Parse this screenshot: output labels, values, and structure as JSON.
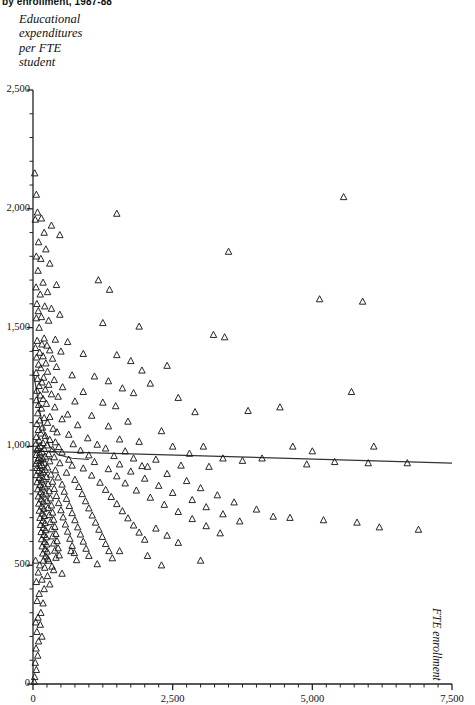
{
  "title": "by enrollment, 1987-88",
  "axis": {
    "y_label": "Educational\nexpenditures\nper FTE\nstudent",
    "x_label": "FTE enrollment"
  },
  "chart_data": {
    "type": "scatter",
    "title": "by enrollment, 1987-88",
    "xlabel": "FTE enrollment",
    "ylabel": "Educational expenditures per FTE student",
    "xlim": [
      0,
      7500
    ],
    "ylim": [
      0,
      2500
    ],
    "grid": false,
    "legend": null,
    "marker": "open-triangle",
    "marker_color": "#1a1a1a",
    "x_ticks": [
      0,
      2500,
      5000,
      7500
    ],
    "x_tick_labels": [
      "0",
      "2,500",
      "5,000",
      "7,500"
    ],
    "x_minor_step": 250,
    "y_ticks": [
      0,
      500,
      1000,
      1500,
      2000,
      2500
    ],
    "y_tick_labels": [
      "0",
      "500",
      "1,000",
      "1,500",
      "2,000",
      "2,500"
    ],
    "y_minor_step": 100,
    "regression_line": {
      "type": "line",
      "color": "#333333",
      "x": [
        0,
        7500
      ],
      "y": [
        980,
        930
      ]
    },
    "fit_curve": {
      "type": "curve",
      "color": "#333333",
      "points": [
        [
          0,
          1320
        ],
        [
          60,
          1240
        ],
        [
          120,
          1150
        ],
        [
          200,
          1060
        ],
        [
          300,
          1000
        ],
        [
          450,
          965
        ],
        [
          700,
          950
        ],
        [
          1000,
          945
        ]
      ]
    },
    "points": [
      [
        30,
        2150
      ],
      [
        60,
        2060
      ],
      [
        5560,
        2050
      ],
      [
        80,
        1985
      ],
      [
        1500,
        1980
      ],
      [
        150,
        1960
      ],
      [
        40,
        1955
      ],
      [
        330,
        1930
      ],
      [
        200,
        1900
      ],
      [
        480,
        1890
      ],
      [
        100,
        1860
      ],
      [
        230,
        1830
      ],
      [
        3500,
        1820
      ],
      [
        60,
        1800
      ],
      [
        140,
        1790
      ],
      [
        300,
        1770
      ],
      [
        90,
        1740
      ],
      [
        1170,
        1700
      ],
      [
        180,
        1690
      ],
      [
        420,
        1680
      ],
      [
        55,
        1670
      ],
      [
        1370,
        1660
      ],
      [
        260,
        1650
      ],
      [
        130,
        1640
      ],
      [
        5130,
        1620
      ],
      [
        5900,
        1610
      ],
      [
        70,
        1600
      ],
      [
        210,
        1590
      ],
      [
        330,
        1580
      ],
      [
        95,
        1570
      ],
      [
        480,
        1555
      ],
      [
        150,
        1545
      ],
      [
        60,
        1540
      ],
      [
        280,
        1530
      ],
      [
        1250,
        1520
      ],
      [
        1900,
        1505
      ],
      [
        110,
        1500
      ],
      [
        3230,
        1470
      ],
      [
        3430,
        1460
      ],
      [
        200,
        1455
      ],
      [
        400,
        1450
      ],
      [
        75,
        1445
      ],
      [
        620,
        1440
      ],
      [
        160,
        1430
      ],
      [
        250,
        1425
      ],
      [
        45,
        1415
      ],
      [
        300,
        1405
      ],
      [
        500,
        1400
      ],
      [
        120,
        1395
      ],
      [
        900,
        1390
      ],
      [
        1500,
        1385
      ],
      [
        180,
        1380
      ],
      [
        65,
        1375
      ],
      [
        350,
        1370
      ],
      [
        1750,
        1360
      ],
      [
        230,
        1350
      ],
      [
        100,
        1345
      ],
      [
        2400,
        1340
      ],
      [
        420,
        1335
      ],
      [
        140,
        1330
      ],
      [
        1950,
        1320
      ],
      [
        260,
        1315
      ],
      [
        55,
        1310
      ],
      [
        700,
        1300
      ],
      [
        1100,
        1295
      ],
      [
        190,
        1290
      ],
      [
        80,
        1285
      ],
      [
        380,
        1280
      ],
      [
        1350,
        1275
      ],
      [
        160,
        1270
      ],
      [
        2100,
        1265
      ],
      [
        280,
        1260
      ],
      [
        110,
        1255
      ],
      [
        530,
        1250
      ],
      [
        1600,
        1245
      ],
      [
        220,
        1240
      ],
      [
        70,
        1235
      ],
      [
        900,
        1230
      ],
      [
        1800,
        1225
      ],
      [
        330,
        1220
      ],
      [
        130,
        1215
      ],
      [
        450,
        1210
      ],
      [
        2600,
        1205
      ],
      [
        180,
        1200
      ],
      [
        60,
        1195
      ],
      [
        750,
        1190
      ],
      [
        1250,
        1185
      ],
      [
        240,
        1180
      ],
      [
        100,
        1175
      ],
      [
        1480,
        1170
      ],
      [
        390,
        1165
      ],
      [
        150,
        1160
      ],
      [
        5700,
        1230
      ],
      [
        4420,
        1165
      ],
      [
        3850,
        1150
      ],
      [
        2900,
        1145
      ],
      [
        85,
        1140
      ],
      [
        620,
        1135
      ],
      [
        1050,
        1130
      ],
      [
        300,
        1125
      ],
      [
        200,
        1120
      ],
      [
        520,
        1115
      ],
      [
        120,
        1110
      ],
      [
        1700,
        1105
      ],
      [
        260,
        1100
      ],
      [
        70,
        1095
      ],
      [
        800,
        1090
      ],
      [
        1350,
        1085
      ],
      [
        170,
        1080
      ],
      [
        360,
        1075
      ],
      [
        95,
        1070
      ],
      [
        2300,
        1065
      ],
      [
        430,
        1060
      ],
      [
        140,
        1055
      ],
      [
        640,
        1050
      ],
      [
        220,
        1045
      ],
      [
        60,
        1040
      ],
      [
        980,
        1035
      ],
      [
        1550,
        1030
      ],
      [
        300,
        1028
      ],
      [
        110,
        1025
      ],
      [
        1900,
        1020
      ],
      [
        400,
        1018
      ],
      [
        180,
        1015
      ],
      [
        55,
        1012
      ],
      [
        720,
        1010
      ],
      [
        1150,
        1008
      ],
      [
        250,
        1005
      ],
      [
        130,
        1002
      ],
      [
        3050,
        1000
      ],
      [
        2500,
        1000
      ],
      [
        460,
        998
      ],
      [
        90,
        995
      ],
      [
        1300,
        992
      ],
      [
        200,
        990
      ],
      [
        350,
        988
      ],
      [
        70,
        985
      ],
      [
        850,
        983
      ],
      [
        1650,
        980
      ],
      [
        160,
        978
      ],
      [
        520,
        975
      ],
      [
        120,
        972
      ],
      [
        2800,
        970
      ],
      [
        280,
        968
      ],
      [
        60,
        965
      ],
      [
        1000,
        963
      ],
      [
        1450,
        960
      ],
      [
        220,
        958
      ],
      [
        380,
        955
      ],
      [
        100,
        952
      ],
      [
        1800,
        950
      ],
      [
        180,
        948
      ],
      [
        640,
        945
      ],
      [
        140,
        942
      ],
      [
        4650,
        1000
      ],
      [
        5000,
        980
      ],
      [
        6100,
        1000
      ],
      [
        6700,
        930
      ],
      [
        3400,
        950
      ],
      [
        2200,
        945
      ],
      [
        4100,
        950
      ],
      [
        3750,
        940
      ],
      [
        5400,
        935
      ],
      [
        6000,
        930
      ],
      [
        4900,
        925
      ],
      [
        2650,
        920
      ],
      [
        1950,
        918
      ],
      [
        3150,
        915
      ],
      [
        80,
        940
      ],
      [
        300,
        938
      ],
      [
        1100,
        935
      ],
      [
        200,
        932
      ],
      [
        480,
        930
      ],
      [
        55,
        928
      ],
      [
        1550,
        925
      ],
      [
        160,
        922
      ],
      [
        700,
        920
      ],
      [
        120,
        918
      ],
      [
        2050,
        915
      ],
      [
        260,
        912
      ],
      [
        70,
        910
      ],
      [
        900,
        908
      ],
      [
        1350,
        905
      ],
      [
        220,
        902
      ],
      [
        400,
        900
      ],
      [
        100,
        898
      ],
      [
        1750,
        895
      ],
      [
        180,
        892
      ],
      [
        600,
        890
      ],
      [
        140,
        888
      ],
      [
        2400,
        885
      ],
      [
        320,
        882
      ],
      [
        60,
        880
      ],
      [
        1050,
        878
      ],
      [
        1500,
        875
      ],
      [
        240,
        872
      ],
      [
        450,
        870
      ],
      [
        110,
        868
      ],
      [
        2000,
        865
      ],
      [
        190,
        862
      ],
      [
        750,
        860
      ],
      [
        150,
        858
      ],
      [
        2750,
        855
      ],
      [
        350,
        852
      ],
      [
        75,
        850
      ],
      [
        1200,
        848
      ],
      [
        1650,
        845
      ],
      [
        270,
        842
      ],
      [
        520,
        840
      ],
      [
        125,
        838
      ],
      [
        2250,
        835
      ],
      [
        210,
        832
      ],
      [
        820,
        830
      ],
      [
        165,
        828
      ],
      [
        3000,
        825
      ],
      [
        380,
        822
      ],
      [
        85,
        820
      ],
      [
        1300,
        818
      ],
      [
        1850,
        815
      ],
      [
        290,
        812
      ],
      [
        560,
        810
      ],
      [
        135,
        808
      ],
      [
        2500,
        805
      ],
      [
        230,
        802
      ],
      [
        880,
        800
      ],
      [
        175,
        798
      ],
      [
        3300,
        795
      ],
      [
        420,
        792
      ],
      [
        95,
        790
      ],
      [
        1400,
        788
      ],
      [
        2100,
        785
      ],
      [
        310,
        782
      ],
      [
        600,
        780
      ],
      [
        145,
        778
      ],
      [
        2850,
        775
      ],
      [
        250,
        772
      ],
      [
        940,
        770
      ],
      [
        185,
        768
      ],
      [
        3600,
        765
      ],
      [
        460,
        762
      ],
      [
        105,
        760
      ],
      [
        1500,
        758
      ],
      [
        2350,
        755
      ],
      [
        330,
        752
      ],
      [
        650,
        750
      ],
      [
        155,
        748
      ],
      [
        3100,
        745
      ],
      [
        270,
        742
      ],
      [
        1000,
        740
      ],
      [
        195,
        738
      ],
      [
        4000,
        735
      ],
      [
        500,
        732
      ],
      [
        115,
        730
      ],
      [
        1600,
        728
      ],
      [
        2600,
        725
      ],
      [
        350,
        722
      ],
      [
        700,
        720
      ],
      [
        165,
        718
      ],
      [
        3400,
        715
      ],
      [
        290,
        712
      ],
      [
        1060,
        710
      ],
      [
        205,
        708
      ],
      [
        4300,
        705
      ],
      [
        540,
        702
      ],
      [
        125,
        700
      ],
      [
        1700,
        698
      ],
      [
        2850,
        695
      ],
      [
        370,
        692
      ],
      [
        750,
        690
      ],
      [
        175,
        688
      ],
      [
        3700,
        685
      ],
      [
        310,
        682
      ],
      [
        1120,
        680
      ],
      [
        215,
        678
      ],
      [
        5200,
        690
      ],
      [
        5800,
        680
      ],
      [
        4600,
        700
      ],
      [
        6200,
        660
      ],
      [
        6900,
        650
      ],
      [
        580,
        672
      ],
      [
        135,
        670
      ],
      [
        1800,
        668
      ],
      [
        3100,
        665
      ],
      [
        390,
        662
      ],
      [
        800,
        660
      ],
      [
        185,
        658
      ],
      [
        2200,
        655
      ],
      [
        330,
        652
      ],
      [
        1180,
        650
      ],
      [
        225,
        648
      ],
      [
        620,
        642
      ],
      [
        145,
        640
      ],
      [
        1900,
        638
      ],
      [
        3350,
        635
      ],
      [
        410,
        632
      ],
      [
        850,
        630
      ],
      [
        195,
        628
      ],
      [
        2400,
        625
      ],
      [
        350,
        622
      ],
      [
        1240,
        620
      ],
      [
        235,
        618
      ],
      [
        660,
        612
      ],
      [
        155,
        610
      ],
      [
        2000,
        608
      ],
      [
        430,
        602
      ],
      [
        900,
        600
      ],
      [
        205,
        598
      ],
      [
        2600,
        595
      ],
      [
        370,
        592
      ],
      [
        1300,
        590
      ],
      [
        245,
        588
      ],
      [
        700,
        582
      ],
      [
        165,
        580
      ],
      [
        450,
        572
      ],
      [
        950,
        570
      ],
      [
        215,
        568
      ],
      [
        390,
        562
      ],
      [
        1360,
        560
      ],
      [
        255,
        558
      ],
      [
        740,
        552
      ],
      [
        175,
        550
      ],
      [
        470,
        542
      ],
      [
        1000,
        540
      ],
      [
        225,
        538
      ],
      [
        410,
        532
      ],
      [
        1420,
        530
      ],
      [
        265,
        528
      ],
      [
        780,
        522
      ],
      [
        185,
        520
      ],
      [
        120,
        500
      ],
      [
        340,
        495
      ],
      [
        95,
        470
      ],
      [
        260,
        455
      ],
      [
        160,
        440
      ],
      [
        60,
        430
      ],
      [
        300,
        420
      ],
      [
        200,
        400
      ],
      [
        110,
        380
      ],
      [
        75,
        350
      ],
      [
        180,
        340
      ],
      [
        140,
        300
      ],
      [
        90,
        280
      ],
      [
        50,
        260
      ],
      [
        130,
        250
      ],
      [
        70,
        220
      ],
      [
        160,
        200
      ],
      [
        100,
        180
      ],
      [
        55,
        150
      ],
      [
        85,
        120
      ],
      [
        40,
        90
      ],
      [
        60,
        60
      ],
      [
        30,
        30
      ],
      [
        20,
        10
      ],
      [
        45,
        520
      ],
      [
        210,
        490
      ],
      [
        370,
        480
      ],
      [
        520,
        465
      ],
      [
        280,
        520
      ],
      [
        680,
        560
      ],
      [
        1550,
        560
      ],
      [
        2050,
        540
      ],
      [
        3000,
        520
      ],
      [
        2300,
        500
      ],
      [
        1150,
        505
      ]
    ]
  }
}
